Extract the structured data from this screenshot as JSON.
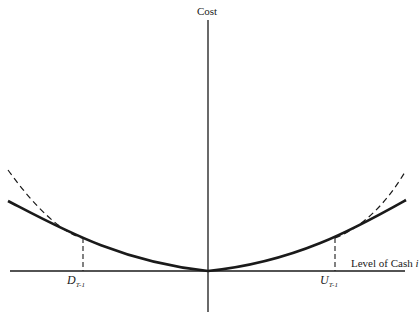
{
  "diagram": {
    "y_axis_label": "Cost",
    "x_axis_label": "Level of Cash",
    "x_axis_variable": "i",
    "lower_bound": {
      "symbol": "D",
      "subscript": "T-1"
    },
    "upper_bound": {
      "symbol": "U",
      "subscript": "T-1"
    },
    "curves": [
      {
        "name": "solid-cost-curve",
        "style": "solid",
        "description": "Convex cost function, minimum at origin"
      },
      {
        "name": "dashed-cost-curve",
        "style": "dashed",
        "description": "Steeper convex curve, tangent to solid curve beyond D and U"
      }
    ],
    "colors": {
      "ink": "#1a1a1a",
      "background": "#ffffff"
    }
  }
}
